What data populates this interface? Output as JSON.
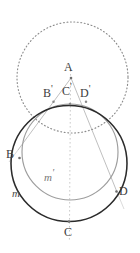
{
  "figure": {
    "background": "#ffffff"
  },
  "colors": {
    "outer_circle_m": "#262626",
    "inner_circle_m_prime": "#9a9a9a",
    "dotted_circle": "#8c8c8c",
    "ray_line": "#b0b0b0",
    "axis_line": "#bdbdbd",
    "label_text": "#3d3d3d",
    "label_italic": "#777777"
  },
  "labels": {
    "apex": "A",
    "b_prime": "B",
    "b_prime_mark": "'",
    "c_prime": "C",
    "c_prime_mark": "'",
    "d_prime": "D",
    "d_prime_mark": "'",
    "b": "B",
    "c": "C",
    "d": "D",
    "curve_m": "m",
    "curve_m_prime": "m",
    "curve_m_prime_mark": "'"
  },
  "geometry": {
    "dotted_circle": {
      "cx": 72.5,
      "cy": 77.5,
      "r": 55.5,
      "style": "dotted"
    },
    "circle_m": {
      "cx": 69,
      "cy": 163.5,
      "r": 58,
      "style": "solid",
      "stroke_width": 1.6
    },
    "circle_m_prime": {
      "cx": 70,
      "cy": 152,
      "r": 48,
      "style": "solid",
      "stroke_width": 1.2
    },
    "points": {
      "A": {
        "x": 71,
        "y": 78
      },
      "B_prime": {
        "x": 53.5,
        "y": 101.5
      },
      "C_prime": {
        "x": 70,
        "y": 104
      },
      "D_prime": {
        "x": 86,
        "y": 101.5
      },
      "B": {
        "x": 24,
        "y": 158
      },
      "C": {
        "x": 69,
        "y": 221.5
      },
      "D": {
        "x": 116,
        "y": 191
      }
    },
    "rays": [
      {
        "name": "ray-A-to-B",
        "from": "A",
        "through": "B_prime",
        "to": "B"
      },
      {
        "name": "ray-A-to-C",
        "from": "A",
        "through": "C_prime",
        "to": "C"
      },
      {
        "name": "ray-A-to-D",
        "from": "A",
        "through": "D_prime",
        "to": "D"
      }
    ]
  },
  "label_positions": {
    "apex": {
      "x": 64,
      "y": 62
    },
    "b_prime": {
      "x": 44,
      "y": 86
    },
    "c_prime": {
      "x": 62,
      "y": 84
    },
    "d_prime": {
      "x": 79,
      "y": 86
    },
    "b": {
      "x": 7,
      "y": 149
    },
    "c": {
      "x": 64,
      "y": 227
    },
    "d": {
      "x": 119,
      "y": 186
    },
    "curve_m": {
      "x": 13,
      "y": 190
    },
    "curve_m_prime": {
      "x": 44,
      "y": 170
    }
  }
}
